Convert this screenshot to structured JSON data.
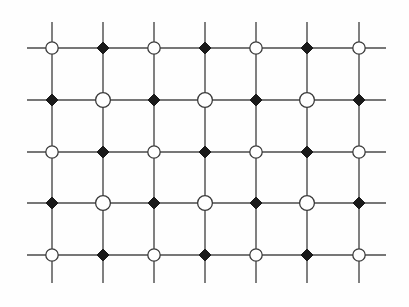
{
  "figure": {
    "kind": "lattice-diagram",
    "background_color": "#fefefe",
    "line_color": "#4a4a4a",
    "line_width": 1.4
  },
  "lattice": {
    "columns": 7,
    "rows": 5,
    "column_x": [
      52,
      103,
      154,
      205,
      256,
      307,
      359
    ],
    "row_y": [
      48,
      100,
      152,
      203,
      255
    ],
    "x_spacing": 51.2,
    "y_spacing": 51.8,
    "stub_left_x": 27,
    "stub_right_x": 386,
    "stub_top_y": 22,
    "stub_bottom_y": 283
  },
  "node_types": {
    "circle": {
      "name": "open-circle-site",
      "shape": "circle",
      "fill": "#ffffff",
      "stroke": "#3a3a3a",
      "stroke_width": 1.3,
      "radius_default": 6.2,
      "radius_large": 7.4
    },
    "diamond": {
      "name": "filled-diamond-site",
      "shape": "diamond",
      "fill": "#1a1a1a",
      "stroke": "#1a1a1a",
      "stroke_width": 1,
      "half_width": 6.0,
      "half_height": 6.0
    }
  },
  "grid_pattern": [
    [
      "circle",
      "diamond",
      "circle",
      "diamond",
      "circle",
      "diamond",
      "circle"
    ],
    [
      "diamond",
      "circle",
      "diamond",
      "circle",
      "diamond",
      "circle",
      "diamond"
    ],
    [
      "circle",
      "diamond",
      "circle",
      "diamond",
      "circle",
      "diamond",
      "circle"
    ],
    [
      "diamond",
      "circle",
      "diamond",
      "circle",
      "diamond",
      "circle",
      "diamond"
    ],
    [
      "circle",
      "diamond",
      "circle",
      "diamond",
      "circle",
      "diamond",
      "circle"
    ]
  ],
  "large_circle_rows": [
    1,
    3
  ],
  "counts": {
    "total_sites": 35,
    "circle_sites": 18,
    "diamond_sites": 17
  }
}
